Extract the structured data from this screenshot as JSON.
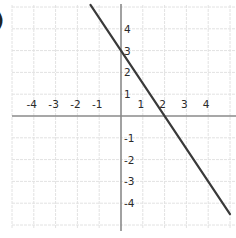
{
  "problem_label": ")",
  "chart_data": {
    "type": "line",
    "title": "",
    "xlabel": "",
    "ylabel": "",
    "xlim": [
      -5,
      5
    ],
    "ylim": [
      -5,
      5
    ],
    "grid": true,
    "x_ticks": [
      -4,
      -3,
      -2,
      -1,
      1,
      2,
      3,
      4
    ],
    "y_ticks": [
      4,
      3,
      2,
      1,
      -1,
      -2,
      -3,
      -4
    ],
    "x_tick_labels": [
      "-4",
      "-3",
      "-2",
      "-1",
      "1",
      "2",
      "3",
      "4"
    ],
    "y_tick_labels": [
      "4",
      "3",
      "2",
      "1",
      "-1",
      "-2",
      "-3",
      "-4"
    ],
    "series": [
      {
        "name": "line",
        "equation": "y = -1.5x + 3",
        "x": [
          -1.4,
          5
        ],
        "y": [
          5.1,
          -4.5
        ],
        "y_intercept": 3,
        "x_intercept": 2,
        "color": "#3a3a3a"
      }
    ],
    "legend": null
  },
  "colors": {
    "grid": "#e2e2e2",
    "axis": "#8a8a8a",
    "line": "#3a3a3a",
    "text": "#2a2a2a"
  }
}
